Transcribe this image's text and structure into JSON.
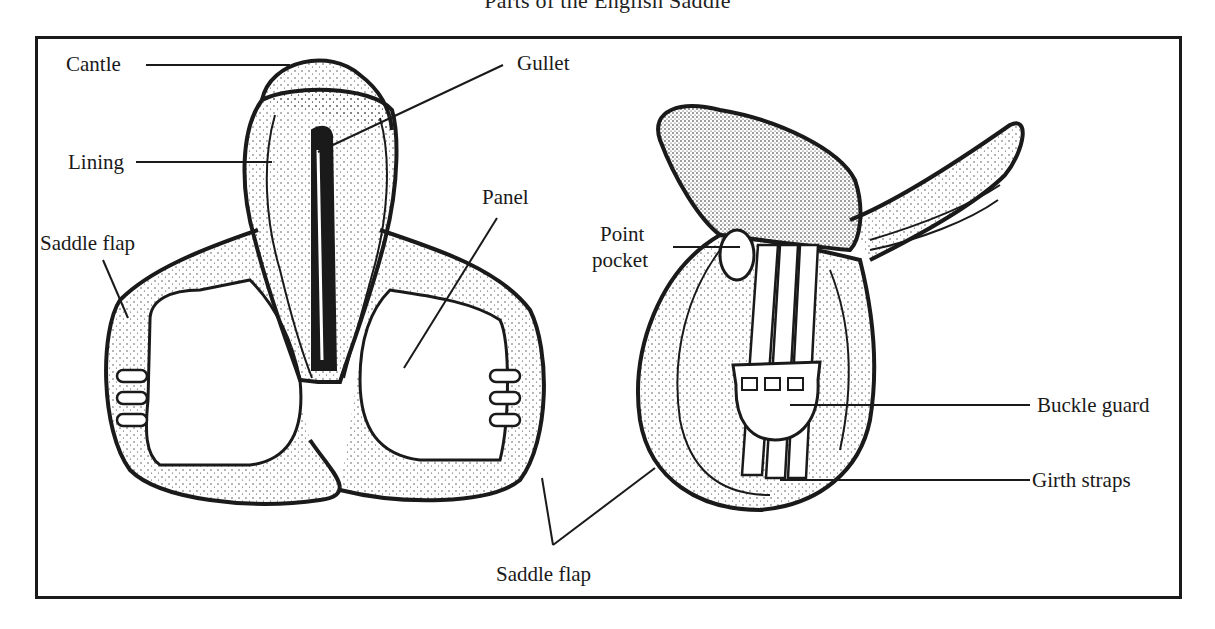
{
  "title": "Parts of the English Saddle",
  "diagram": {
    "views": [
      "underside view",
      "side view"
    ],
    "labels": {
      "cantle": "Cantle",
      "gullet": "Gullet",
      "lining": "Lining",
      "saddle_flap_left": "Saddle flap",
      "panel": "Panel",
      "point_pocket_line1": "Point",
      "point_pocket_line2": "pocket",
      "buckle_guard": "Buckle guard",
      "girth_straps": "Girth straps",
      "saddle_flap_bottom": "Saddle flap"
    },
    "colors": {
      "ink": "#1a1a1a",
      "paper": "#ffffff"
    }
  }
}
